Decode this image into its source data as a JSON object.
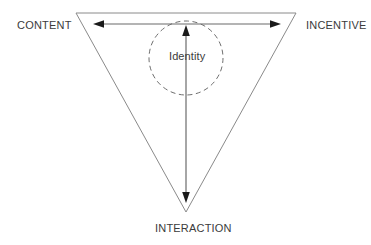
{
  "diagram": {
    "type": "inverted-triangle-venn",
    "title": "",
    "vertices": [
      {
        "id": "content",
        "label": "CONTENT",
        "position": "top-left",
        "x": 76,
        "y": 13
      },
      {
        "id": "incentive",
        "label": "INCENTIVE",
        "position": "top-right",
        "x": 296,
        "y": 13
      },
      {
        "id": "interaction",
        "label": "INTERACTION",
        "position": "bottom",
        "x": 186,
        "y": 212
      }
    ],
    "center": {
      "id": "identity",
      "label": "Identity",
      "shape": "circle",
      "stroke_style": "dashed",
      "cx": 186,
      "cy": 58,
      "r": 37
    },
    "arrows": [
      {
        "id": "content-incentive",
        "from": "content",
        "to": "incentive",
        "direction": "bidirectional",
        "x1": 94,
        "y1": 24,
        "x2": 280,
        "y2": 24
      },
      {
        "id": "identity-interaction",
        "from": "identity",
        "to": "interaction",
        "direction": "bidirectional",
        "x1": 186,
        "y1": 26,
        "x2": 186,
        "y2": 202
      }
    ],
    "colors": {
      "triangle_stroke": "#8a8a8a",
      "circle_stroke": "#6e6e6e",
      "arrow_stroke": "#6b6b6b",
      "arrow_head": "#1a1a1a",
      "text": "#3b3b3b",
      "background": "#ffffff"
    }
  }
}
